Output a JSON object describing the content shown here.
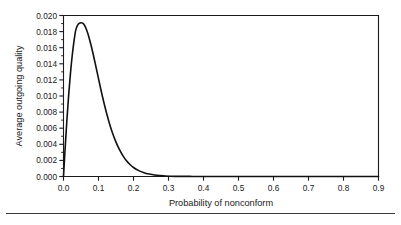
{
  "chart_data": {
    "type": "line",
    "title": "",
    "xlabel": "Probability of nonconform",
    "ylabel": "Average outgoing quality",
    "xlim": [
      0.0,
      0.9
    ],
    "ylim": [
      0.0,
      0.02
    ],
    "grid": false,
    "legend": null,
    "x_ticks": [
      "0.0",
      "0.1",
      "0.2",
      "0.3",
      "0.4",
      "0.5",
      "0.6",
      "0.7",
      "0.8",
      "0.9"
    ],
    "x_tick_values": [
      0.0,
      0.1,
      0.2,
      0.3,
      0.4,
      0.5,
      0.6,
      0.7,
      0.8,
      0.9
    ],
    "y_ticks": [
      "0.000",
      "0.002",
      "0.004",
      "0.006",
      "0.008",
      "0.010",
      "0.012",
      "0.014",
      "0.016",
      "0.018",
      "0.020"
    ],
    "y_tick_values": [
      0.0,
      0.002,
      0.004,
      0.006,
      0.008,
      0.01,
      0.012,
      0.014,
      0.016,
      0.018,
      0.02
    ],
    "y_minor_step": 0.001,
    "line_color": "#111111",
    "peak": {
      "x": 0.055,
      "y": 0.0191
    },
    "series": [
      {
        "name": "Average outgoing quality",
        "x": [
          0.0,
          0.005,
          0.01,
          0.015,
          0.02,
          0.025,
          0.03,
          0.035,
          0.04,
          0.045,
          0.05,
          0.055,
          0.06,
          0.065,
          0.07,
          0.075,
          0.08,
          0.085,
          0.09,
          0.095,
          0.1,
          0.11,
          0.12,
          0.13,
          0.14,
          0.15,
          0.16,
          0.17,
          0.18,
          0.19,
          0.2,
          0.215,
          0.23,
          0.245,
          0.26,
          0.275,
          0.29,
          0.305,
          0.32,
          0.34,
          0.36,
          0.38,
          0.4,
          0.43,
          0.46,
          0.5,
          0.55,
          0.6,
          0.65,
          0.7,
          0.75,
          0.8,
          0.85,
          0.9
        ],
        "y": [
          0.0,
          0.00374,
          0.00721,
          0.01026,
          0.01288,
          0.01506,
          0.01682,
          0.01818,
          0.01879,
          0.01903,
          0.0191,
          0.01906,
          0.01879,
          0.01832,
          0.01769,
          0.01693,
          0.01608,
          0.01515,
          0.01417,
          0.01317,
          0.01216,
          0.01019,
          0.00838,
          0.00678,
          0.00541,
          0.00427,
          0.00333,
          0.00257,
          0.00196,
          0.00149,
          0.00112,
          0.00073,
          0.00047,
          0.0003,
          0.00018,
          0.00011,
          7e-05,
          4e-05,
          2e-05,
          1e-05,
          1e-05,
          0.0,
          0.0,
          0.0,
          0.0,
          0.0,
          0.0,
          0.0,
          0.0,
          0.0,
          0.0,
          0.0,
          0.0,
          0.0
        ]
      }
    ]
  },
  "figure": {
    "y_axis_title": "Average outgoing quality",
    "x_axis_title": "Probability of nonconform"
  }
}
